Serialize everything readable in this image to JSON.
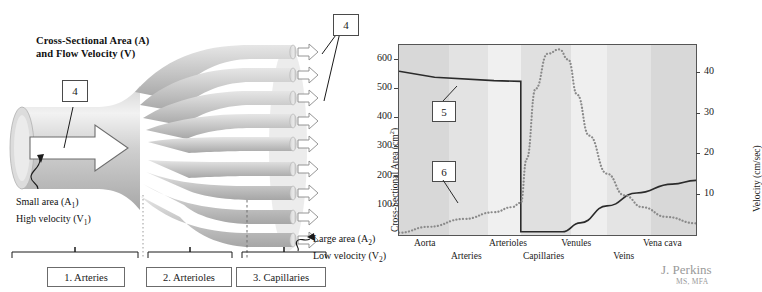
{
  "diagram": {
    "title_line1": "Cross-Sectional Area (A)",
    "title_line2": "and Flow Velocity (V)",
    "callout_inlet": "4",
    "callout_outlet": "4",
    "small_area_line1": "Small area (A",
    "small_area_sub1": "1",
    "small_area_line1_end": ")",
    "small_area_line2": "High velocity (V",
    "small_area_sub2": "1",
    "small_area_line2_end": ")",
    "large_area_line1": "Large area (A",
    "large_area_sub1": "2",
    "large_area_line1_end": ")",
    "large_area_line2": "Low velocity (V",
    "large_area_sub2": "2",
    "large_area_line2_end": ")",
    "segments": [
      {
        "label": "1. Arteries"
      },
      {
        "label": "2. Arterioles"
      },
      {
        "label": "3. Capillaries"
      }
    ],
    "vessel_fill_light": "#e2e2e2",
    "vessel_fill_mid": "#c8c8c8",
    "vessel_fill_dark": "#a9a9a9"
  },
  "chart_data": {
    "type": "line",
    "title": "",
    "xlabel": "",
    "ylabel": "Cross-Sectional Area (cm",
    "ylabel_sup": "2",
    "ylabel_end": ")",
    "y2label": "Velocity (cm/sec)",
    "grid": false,
    "legend_position": "none",
    "ylim": [
      0,
      650
    ],
    "yticks": [
      100,
      200,
      300,
      400,
      500,
      600
    ],
    "y2lim": [
      0,
      47
    ],
    "y2ticks": [
      10,
      20,
      30,
      40
    ],
    "categories": [
      "Aorta",
      "Arteries",
      "Arterioles",
      "Capillaries",
      "Venules",
      "Veins",
      "Vena cava"
    ],
    "xtick_labels_top": [
      "Aorta",
      "Arterioles",
      "Venules",
      "Vena cava"
    ],
    "xtick_labels_bottom": [
      "Arteries",
      "Capillaries",
      "Veins"
    ],
    "callout_velocity": "5",
    "callout_area": "6",
    "series": [
      {
        "name": "Velocity (cm/sec)",
        "axis": "right",
        "style": "solid",
        "color": "#2b2b2b",
        "x": [
          0,
          12,
          32,
          41,
          41,
          55,
          61,
          70,
          80,
          92,
          100
        ],
        "values": [
          40.5,
          39.0,
          38.2,
          38.0,
          0.8,
          0.8,
          3.0,
          7.2,
          10.4,
          12.6,
          13.5
        ]
      },
      {
        "name": "Cross-Sectional Area (cm2)",
        "axis": "left",
        "style": "dotted",
        "color": "#8a8a8a",
        "x": [
          0,
          10,
          22,
          32,
          38,
          41,
          43,
          46,
          50,
          54,
          57,
          60,
          64,
          70,
          76,
          82,
          90,
          100
        ],
        "values": [
          8,
          28,
          55,
          78,
          95,
          110,
          260,
          500,
          620,
          635,
          600,
          480,
          340,
          210,
          135,
          95,
          62,
          40
        ]
      }
    ],
    "bands": [
      {
        "name": "Aorta",
        "x0": 0,
        "x1": 17,
        "color": "#d8d8d8"
      },
      {
        "name": "Arteries",
        "x0": 17,
        "x1": 30,
        "color": "#e3e3e3"
      },
      {
        "name": "Arterioles",
        "x0": 30,
        "x1": 41,
        "color": "#f0f0f0"
      },
      {
        "name": "Capillaries",
        "x0": 41,
        "x1": 58,
        "color": "#e0e0e0"
      },
      {
        "name": "Venules",
        "x0": 58,
        "x1": 70,
        "color": "#efefef"
      },
      {
        "name": "Veins",
        "x0": 70,
        "x1": 85,
        "color": "#e4e4e4"
      },
      {
        "name": "Vena cava",
        "x0": 85,
        "x1": 100,
        "color": "#d8d8d8"
      }
    ]
  },
  "credit": {
    "name": "J. Perkins",
    "credentials": "MS, MFA",
    "color": "#9a9a9a"
  }
}
